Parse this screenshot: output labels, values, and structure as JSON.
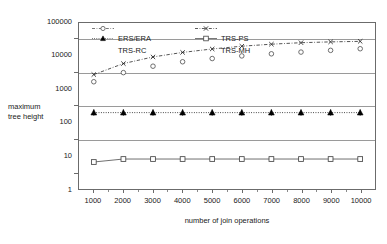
{
  "chart_data": {
    "type": "line",
    "title": "",
    "xlabel": "number of join operations",
    "ylabel": "maximum tree height",
    "x": [
      1000,
      2000,
      3000,
      4000,
      5000,
      6000,
      7000,
      8000,
      9000,
      10000
    ],
    "xtick_labels": [
      "1000",
      "2000",
      "3000",
      "4000",
      "5000",
      "6000",
      "7000",
      "8000",
      "9000",
      "10000"
    ],
    "ytick_labels": [
      "1",
      "10",
      "100",
      "1000",
      "10000",
      "100000"
    ],
    "ytick_values": [
      1,
      10,
      100,
      1000,
      10000,
      100000
    ],
    "ylim": [
      1,
      100000
    ],
    "yscale": "log",
    "xlim": [
      500,
      10500
    ],
    "grid": "horizontal-mid-decade",
    "gridline_values": [
      30,
      300,
      3000,
      30000
    ],
    "legend_position": "upper-left-inside",
    "series": [
      {
        "name": "ERS/ERA",
        "marker": "open-circle",
        "line": "none",
        "color": "#555555",
        "values": [
          1700,
          3200,
          5000,
          6800,
          8500,
          10200,
          11800,
          13300,
          15000,
          16800
        ]
      },
      {
        "name": "TRS-PS",
        "marker": "cross-x",
        "line": "dash-dot",
        "color": "#333333",
        "values": [
          2800,
          6000,
          9500,
          13000,
          16500,
          20000,
          23000,
          25500,
          27000,
          28000
        ]
      },
      {
        "name": "TRS-RC",
        "marker": "filled-triangle",
        "line": "dotted",
        "color": "#000000",
        "values": [
          200,
          200,
          200,
          200,
          200,
          200,
          200,
          200,
          200,
          200
        ]
      },
      {
        "name": "TRS-MH",
        "marker": "open-square",
        "line": "solid",
        "color": "#555555",
        "values": [
          6.5,
          8,
          8,
          8,
          8,
          8,
          8,
          8,
          8,
          8
        ]
      }
    ]
  },
  "axis": {
    "y_label_line1": "maximum",
    "y_label_line2": "tree height",
    "x_label": "number of join operations"
  },
  "legend": {
    "items": [
      {
        "label": "ERS/ERA",
        "marker": "open-circle",
        "line": "dash-dot"
      },
      {
        "label": "TRS-PS",
        "marker": "cross-x",
        "line": "dash-dot"
      },
      {
        "label": "TRS-RC",
        "marker": "filled-triangle",
        "line": "dotted"
      },
      {
        "label": "TRS-MH",
        "marker": "open-square",
        "line": "solid"
      }
    ]
  },
  "colors": {
    "axis": "#6b6b6b",
    "grid": "#9a9a9a",
    "text": "#1a1a1a",
    "series_dark": "#333333",
    "series_gray": "#555555"
  }
}
